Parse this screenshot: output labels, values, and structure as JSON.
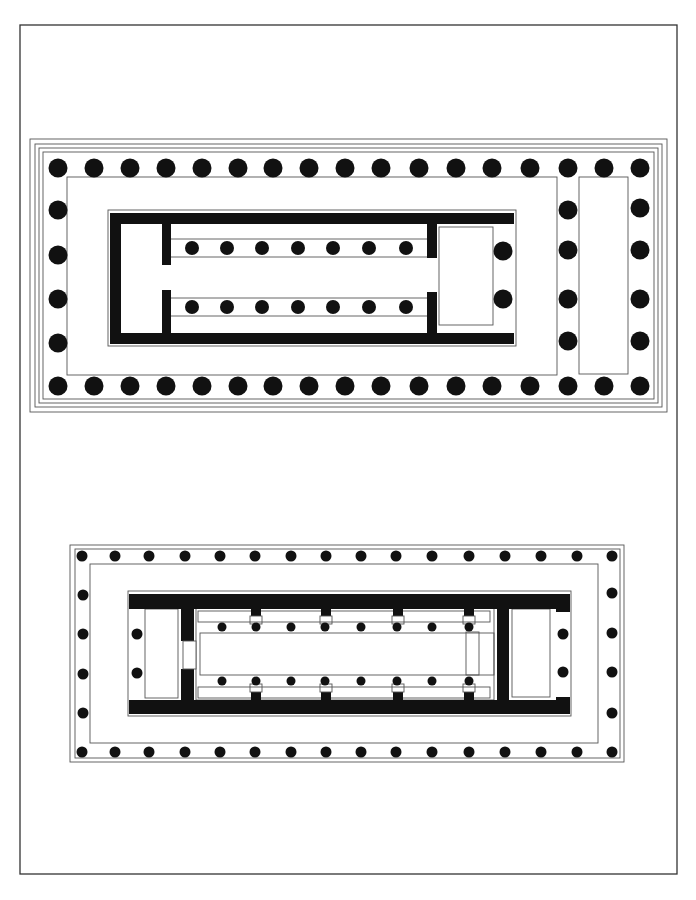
{
  "drawing": {
    "title": "Greek peripteral temple ground plans",
    "colors": {
      "ink": "#111111",
      "line": "#555555",
      "paper": "#ffffff",
      "frame": "#333333"
    },
    "frame": {
      "x": 20,
      "y": 25,
      "w": 657,
      "h": 849
    }
  },
  "plans": [
    {
      "id": "upper-plan",
      "borders": [
        {
          "x": 30,
          "y": 139,
          "w": 637,
          "h": 273
        },
        {
          "x": 35,
          "y": 144,
          "w": 627,
          "h": 263
        },
        {
          "x": 39,
          "y": 148,
          "w": 619,
          "h": 255
        },
        {
          "x": 43,
          "y": 152,
          "w": 611,
          "h": 247
        }
      ],
      "stylobate_inner": {
        "x": 67,
        "y": 177,
        "w": 490,
        "h": 198
      },
      "rear_inner": {
        "x": 579,
        "y": 177,
        "w": 49,
        "h": 197
      },
      "column_radius": 9.5,
      "peristyle_columns": {
        "top_y": 168,
        "bottom_y": 386,
        "row_x": [
          58,
          94,
          130,
          166,
          202,
          238,
          273,
          309,
          345,
          381,
          419,
          456,
          492,
          530,
          568,
          604,
          640
        ],
        "left_x": 58,
        "side_y": [
          210,
          255,
          299,
          343
        ],
        "right_x": 640,
        "right_side_y": [
          208,
          250,
          299,
          341
        ],
        "inner_right_x": 568,
        "inner_right_y": [
          210,
          250,
          299,
          341
        ]
      },
      "cella": {
        "outline": {
          "x": 108,
          "y": 210,
          "w": 408,
          "h": 136
        },
        "walls": [
          {
            "x": 110,
            "y": 213,
            "w": 404,
            "h": 11
          },
          {
            "x": 110,
            "y": 333,
            "w": 404,
            "h": 11
          },
          {
            "x": 110,
            "y": 213,
            "w": 11,
            "h": 131
          },
          {
            "x": 162,
            "y": 213,
            "w": 9,
            "h": 52
          },
          {
            "x": 162,
            "y": 290,
            "w": 9,
            "h": 54
          },
          {
            "x": 427,
            "y": 213,
            "w": 10,
            "h": 45
          },
          {
            "x": 427,
            "y": 292,
            "w": 10,
            "h": 52
          }
        ],
        "aisle_lines_y": [
          239,
          257,
          298,
          316
        ],
        "aisle_x": [
          171,
          427
        ],
        "room": {
          "x": 439,
          "y": 227,
          "w": 54,
          "h": 98
        },
        "inner_column_radius": 7,
        "inner_columns": {
          "x": [
            192,
            227,
            262,
            298,
            333,
            369,
            406
          ],
          "y": [
            248,
            307
          ]
        },
        "porch_columns": {
          "x": 503,
          "y": [
            251,
            299
          ],
          "r": 9.5
        }
      }
    },
    {
      "id": "lower-plan",
      "borders": [
        {
          "x": 70,
          "y": 545,
          "w": 554,
          "h": 217
        },
        {
          "x": 75,
          "y": 549,
          "w": 545,
          "h": 209
        }
      ],
      "stylobate_inner": {
        "x": 90,
        "y": 564,
        "w": 508,
        "h": 179
      },
      "column_radius": 5.5,
      "peristyle_columns": {
        "top_y": 556,
        "bottom_y": 752,
        "row_x": [
          82,
          115,
          149,
          185,
          220,
          255,
          291,
          326,
          361,
          396,
          432,
          469,
          505,
          541,
          577,
          612
        ],
        "left_x": 83,
        "side_y": [
          595,
          634,
          674,
          713
        ],
        "right_x": 612,
        "right_side_y": [
          593,
          633,
          672,
          713
        ]
      },
      "cella": {
        "outline": {
          "x": 128,
          "y": 591,
          "w": 443,
          "h": 125
        },
        "walls": [
          {
            "x": 129,
            "y": 594,
            "w": 441,
            "h": 15
          },
          {
            "x": 129,
            "y": 700,
            "w": 441,
            "h": 14
          },
          {
            "x": 181,
            "y": 594,
            "w": 13,
            "h": 47
          },
          {
            "x": 181,
            "y": 669,
            "w": 13,
            "h": 45
          },
          {
            "x": 497,
            "y": 594,
            "w": 12,
            "h": 120
          },
          {
            "x": 556,
            "y": 594,
            "w": 14,
            "h": 18
          },
          {
            "x": 556,
            "y": 697,
            "w": 14,
            "h": 17
          }
        ],
        "door": {
          "x": 183,
          "y": 641,
          "w": 13,
          "h": 28
        },
        "front_room": {
          "x": 145,
          "y": 609,
          "w": 33,
          "h": 89
        },
        "rear_room": {
          "x": 512,
          "y": 609,
          "w": 38,
          "h": 88
        },
        "naos_frame": {
          "x": 196,
          "y": 608,
          "w": 298,
          "h": 92
        },
        "aisle_strips": [
          {
            "x": 198,
            "y": 611,
            "w": 292,
            "h": 11
          },
          {
            "x": 198,
            "y": 687,
            "w": 292,
            "h": 11
          }
        ],
        "nave": {
          "x": 200,
          "y": 633,
          "w": 294,
          "h": 42
        },
        "rear_block": {
          "x": 466,
          "y": 632,
          "w": 13,
          "h": 43
        },
        "pilasters_x": [
          250,
          320,
          392,
          463
        ],
        "pilaster_w": 12,
        "inner_column_radius": 4.5,
        "inner_columns": {
          "x": [
            222,
            256,
            291,
            325,
            361,
            397,
            432,
            469
          ],
          "y": [
            627,
            681
          ]
        },
        "porch_columns": [
          {
            "x": 137,
            "y": 634
          },
          {
            "x": 137,
            "y": 673
          },
          {
            "x": 563,
            "y": 634
          },
          {
            "x": 563,
            "y": 672
          }
        ],
        "porch_column_radius": 5.5
      }
    }
  ]
}
